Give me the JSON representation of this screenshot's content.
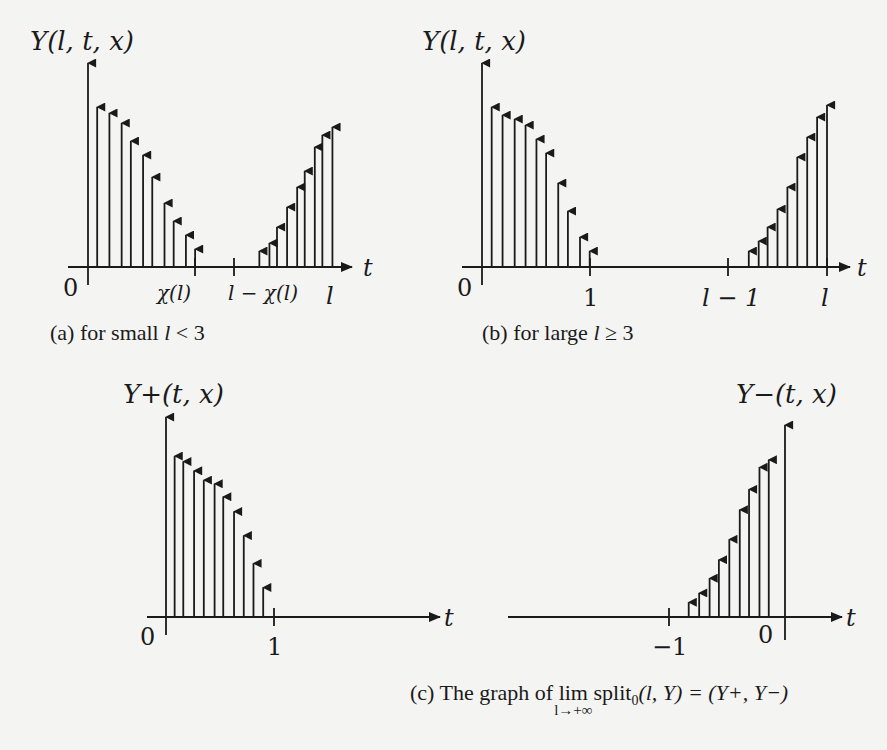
{
  "figure": {
    "panels": [
      {
        "id": "a",
        "ylabel": "Y(l, t, x)",
        "xlabel": "t",
        "tick_labels": [
          "0",
          "χ(l)",
          "l − χ(l)",
          "l"
        ],
        "caption": "(a) for small l < 3",
        "caption_parts": {
          "prefix": "(a) for small ",
          "var": "l",
          "suffix": " < 3"
        }
      },
      {
        "id": "b",
        "ylabel": "Y(l, t, x)",
        "xlabel": "t",
        "tick_labels": [
          "0",
          "1",
          "l − 1",
          "l"
        ],
        "caption": "(b) for large l ≥ 3",
        "caption_parts": {
          "prefix": "(b) for large ",
          "var": "l",
          "suffix": " ≥ 3"
        }
      },
      {
        "id": "c-left",
        "ylabel": "Y+(t, x)",
        "xlabel": "t",
        "tick_labels": [
          "0",
          "1"
        ]
      },
      {
        "id": "c-right",
        "ylabel": "Y−(t, x)",
        "xlabel": "t",
        "tick_labels": [
          "−1",
          "0"
        ]
      }
    ],
    "caption_c": {
      "prefix": "(c) The graph of ",
      "lim": "lim",
      "lim_sub": "l→+∞",
      "func": "split",
      "func_sub": "0",
      "args": "(l, Y) = (Y+, Y−)"
    }
  },
  "chart_data": [
    {
      "type": "stem",
      "title": "(a) for small l < 3",
      "ylabel": "Y(l,t,x)",
      "xlabel": "t",
      "x_ticks": [
        "0",
        "χ(l)",
        "l−χ(l)",
        "l"
      ],
      "series": [
        {
          "name": "left cluster (decreasing)",
          "x_rel": [
            0.03,
            0.07,
            0.11,
            0.14,
            0.18,
            0.21,
            0.25,
            0.28,
            0.32,
            0.35
          ],
          "heights": [
            0.8,
            0.77,
            0.72,
            0.63,
            0.56,
            0.45,
            0.32,
            0.23,
            0.16,
            0.09
          ]
        },
        {
          "name": "right cluster (increasing)",
          "x_rel": [
            0.68,
            0.72,
            0.75,
            0.79,
            0.83,
            0.86,
            0.9,
            0.93,
            0.97
          ],
          "heights": [
            0.08,
            0.12,
            0.2,
            0.3,
            0.4,
            0.48,
            0.6,
            0.66,
            0.7
          ]
        }
      ],
      "grid": false
    },
    {
      "type": "stem",
      "title": "(b) for large l ≥ 3",
      "ylabel": "Y(l,t,x)",
      "xlabel": "t",
      "x_ticks": [
        "0",
        "1",
        "l−1",
        "l"
      ],
      "series": [
        {
          "name": "left cluster in [0,1] (decreasing)",
          "x_rel": [
            0.08,
            0.17,
            0.27,
            0.36,
            0.45,
            0.53,
            0.63,
            0.71,
            0.81,
            0.89
          ],
          "heights": [
            0.8,
            0.76,
            0.74,
            0.71,
            0.64,
            0.57,
            0.42,
            0.28,
            0.15,
            0.08
          ]
        },
        {
          "name": "right cluster in [l−1,l] (increasing)",
          "x_rel": [
            0.21,
            0.31,
            0.4,
            0.5,
            0.6,
            0.7,
            0.8,
            0.9,
            1.0
          ],
          "heights": [
            0.08,
            0.13,
            0.2,
            0.29,
            0.4,
            0.55,
            0.65,
            0.75,
            0.81
          ]
        }
      ],
      "grid": false
    },
    {
      "type": "stem",
      "title": "Y+(t,x)",
      "ylabel": "Y+(t,x)",
      "xlabel": "t",
      "x_ticks": [
        "0",
        "1"
      ],
      "series": [
        {
          "name": "Y+",
          "x": [
            0.08,
            0.16,
            0.26,
            0.35,
            0.45,
            0.53,
            0.63,
            0.72,
            0.81,
            0.9
          ],
          "heights": [
            0.87,
            0.84,
            0.79,
            0.74,
            0.72,
            0.65,
            0.57,
            0.44,
            0.29,
            0.16
          ]
        }
      ],
      "grid": false
    },
    {
      "type": "stem",
      "title": "Y−(t,x)",
      "ylabel": "Y−(t,x)",
      "xlabel": "t",
      "x_ticks": [
        "−1",
        "0"
      ],
      "series": [
        {
          "name": "Y−",
          "x": [
            -0.83,
            -0.74,
            -0.65,
            -0.57,
            -0.48,
            -0.39,
            -0.31,
            -0.22,
            -0.14
          ],
          "heights": [
            0.08,
            0.13,
            0.21,
            0.31,
            0.42,
            0.58,
            0.69,
            0.81,
            0.85
          ]
        }
      ],
      "grid": false
    }
  ]
}
